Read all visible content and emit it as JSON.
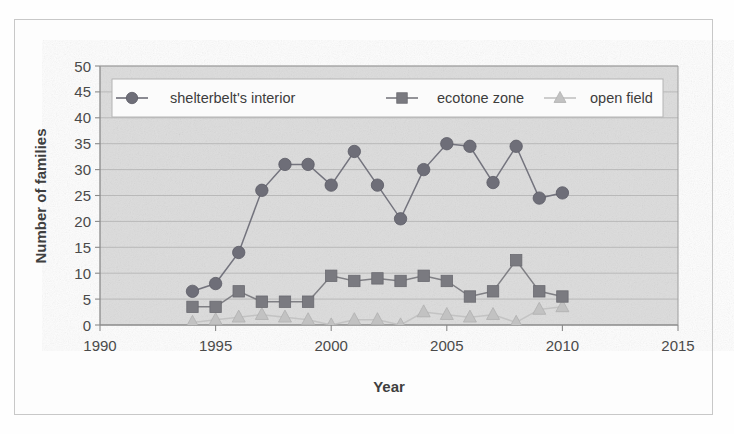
{
  "chart_data": {
    "type": "line",
    "title": "",
    "xlabel": "Year",
    "ylabel": "Number of families",
    "xlim": [
      1990,
      2015
    ],
    "ylim": [
      0,
      50
    ],
    "xticks": [
      1990,
      1995,
      2000,
      2005,
      2010,
      2015
    ],
    "yticks": [
      0,
      5,
      10,
      15,
      20,
      25,
      30,
      35,
      40,
      45,
      50
    ],
    "grid": true,
    "legend_position": "top-inside",
    "x": [
      1994,
      1995,
      1996,
      1997,
      1998,
      1999,
      2000,
      2001,
      2002,
      2003,
      2004,
      2005,
      2006,
      2007,
      2008,
      2009,
      2010
    ],
    "series": [
      {
        "name": "shelterbelt's interior",
        "marker": "circle",
        "color": "#6e6e78",
        "values": [
          6.5,
          8,
          14,
          26,
          31,
          31,
          27,
          33.5,
          27,
          20.5,
          30,
          35,
          34.5,
          27.5,
          34.5,
          24.5,
          25.5
        ]
      },
      {
        "name": "ecotone zone",
        "marker": "square",
        "color": "#7a7a80",
        "values": [
          3.5,
          3.5,
          6.5,
          4.5,
          4.5,
          4.5,
          9.5,
          8.5,
          9,
          8.5,
          9.5,
          8.5,
          5.5,
          6.5,
          12.5,
          6.5,
          5.5
        ]
      },
      {
        "name": "open field",
        "marker": "triangle",
        "color": "#c2c2c2",
        "values": [
          0.5,
          1,
          1.5,
          2,
          1.5,
          1,
          0,
          1,
          1,
          0,
          2.5,
          2,
          1.5,
          2,
          0.5,
          3,
          3.5
        ]
      }
    ]
  },
  "axes": {
    "x_title": "Year",
    "y_title": "Number of families",
    "x_tick_labels": [
      "1990",
      "1995",
      "2000",
      "2005",
      "2010",
      "2015"
    ],
    "y_tick_labels": [
      "0",
      "5",
      "10",
      "15",
      "20",
      "25",
      "30",
      "35",
      "40",
      "45",
      "50"
    ]
  },
  "legend": {
    "entries": [
      {
        "label": "shelterbelt's interior",
        "marker": "circle-marker-icon"
      },
      {
        "label": "ecotone zone",
        "marker": "square-marker-icon"
      },
      {
        "label": "open field",
        "marker": "triangle-marker-icon"
      }
    ]
  },
  "colors": {
    "plot_background": "#dedede",
    "series_dark": "#6e6e78",
    "series_mid": "#7a7a80",
    "series_light": "#c2c2c2",
    "grid": "#a9a9a9",
    "axis": "#8a8a8a",
    "text": "#4a4a4a"
  }
}
